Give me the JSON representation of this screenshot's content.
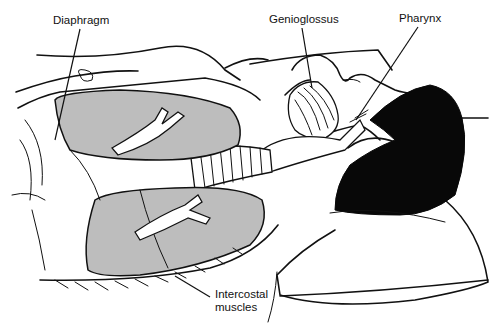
{
  "figure": {
    "labels": [
      {
        "id": "diaphragm",
        "text": "Diaphragm"
      },
      {
        "id": "genioglossus",
        "text": "Genioglossus"
      },
      {
        "id": "pharynx",
        "text": "Pharynx"
      },
      {
        "id": "intercostal",
        "text": "Intercostal\nmuscles"
      }
    ]
  },
  "colors": {
    "ink": "#111111",
    "lung_fill": "#bdbdbd",
    "hair": "#080808",
    "background": "#ffffff"
  }
}
